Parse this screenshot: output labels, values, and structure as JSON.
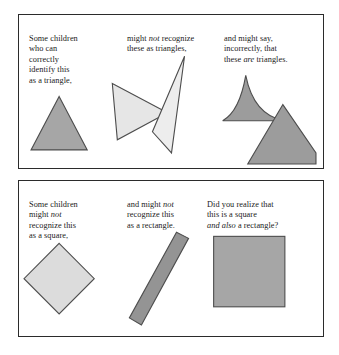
{
  "figure": {
    "title_text_present": false,
    "panels": [
      {
        "id": "triangles",
        "columns": [
          {
            "name": "col-1",
            "lines": [
              "Some children",
              "who can",
              "correctly",
              "identify this",
              "as a triangle,"
            ],
            "text": "Some children\nwho can\ncorrectly\nidentify this\nas a triangle,"
          },
          {
            "name": "col-2",
            "lines": [
              "might not recognize",
              "these as triangles,"
            ],
            "text_before_em": "might ",
            "em_word": "not",
            "text_after_em": " recognize\nthese as triangles,"
          },
          {
            "name": "col-3",
            "lines": [
              "and might say,",
              "incorrectly, that",
              "these are triangles."
            ],
            "text_before_em": "and might say,\nincorrectly, that\nthese ",
            "em_word": "are",
            "text_after_em": " triangles."
          }
        ],
        "shapes": [
          {
            "name": "equilateral-triangle",
            "fill": "#a6a6a6",
            "stroke": "#4d4d4d"
          },
          {
            "name": "right-pointing-triangle",
            "fill": "#e6e6e6",
            "stroke": "#4d4d4d"
          },
          {
            "name": "thin-sliver-triangle",
            "fill": "#ededed",
            "stroke": "#4d4d4d"
          },
          {
            "name": "concave-curved-triangle",
            "fill": "#9c9c9c",
            "stroke": "#4d4d4d"
          },
          {
            "name": "clipped-corner-quadrilateral",
            "fill": "#9c9c9c",
            "stroke": "#4d4d4d"
          }
        ]
      },
      {
        "id": "quads",
        "columns": [
          {
            "name": "col-1",
            "lines": [
              "Some children",
              "might not",
              "recognize this",
              "as  a square,"
            ],
            "text_before_em": "Some children\nmight ",
            "em_word": "not",
            "text_after_em": "\nrecognize this\nas  a square,"
          },
          {
            "name": "col-2",
            "lines": [
              "and might not",
              "recognize this",
              "as a rectangle."
            ],
            "text_before_em": "and might ",
            "em_word": "not",
            "text_after_em": "\nrecognize this\nas a rectangle."
          },
          {
            "name": "col-3",
            "lines": [
              "Did you realize that",
              "this is a square",
              "and also a rectangle?"
            ],
            "text_before_em": "Did you realize that\nthis is a square\n",
            "em_word": "and also",
            "text_after_em": " a rectangle?"
          }
        ],
        "shapes": [
          {
            "name": "rotated-square-diamond",
            "fill": "#dcdcdc",
            "stroke": "#4d4d4d"
          },
          {
            "name": "tilted-thin-rectangle",
            "fill": "#949494",
            "stroke": "#4d4d4d"
          },
          {
            "name": "upright-square",
            "fill": "#a6a6a6",
            "stroke": "#4d4d4d"
          }
        ]
      }
    ],
    "colors": {
      "border": "#2b2b2b",
      "text": "#1a1a1a",
      "background": "#ffffff",
      "gray_dark": "#949494",
      "gray_medium": "#a6a6a6",
      "gray_light": "#dcdcdc",
      "gray_lightest": "#ededed",
      "outline": "#4d4d4d"
    }
  }
}
